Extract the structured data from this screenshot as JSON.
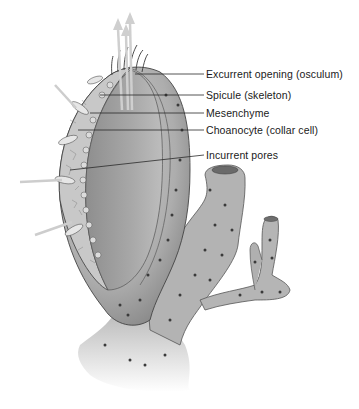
{
  "figure": {
    "labels": [
      {
        "id": "osculum",
        "text": "Excurrent opening (osculum)",
        "x": 206,
        "y": 68
      },
      {
        "id": "spicule",
        "text": "Spicule (skeleton)",
        "x": 206,
        "y": 89
      },
      {
        "id": "mesenchyme",
        "text": "Mesenchyme",
        "x": 206,
        "y": 107
      },
      {
        "id": "choanocyte",
        "text": "Choanocyte (collar cell)",
        "x": 206,
        "y": 124
      },
      {
        "id": "incurrent",
        "text": "Incurrent pores",
        "x": 206,
        "y": 149
      }
    ],
    "colors": {
      "body_fill": "#b8b8b8",
      "body_shade": "#8f8f8f",
      "inner_cavity": "#9a9a9a",
      "outline": "#3a3a3a",
      "flow_arrows": "#d0d0d0",
      "leader_line": "#2a2a2a",
      "label_text": "#1a1a1a"
    }
  }
}
